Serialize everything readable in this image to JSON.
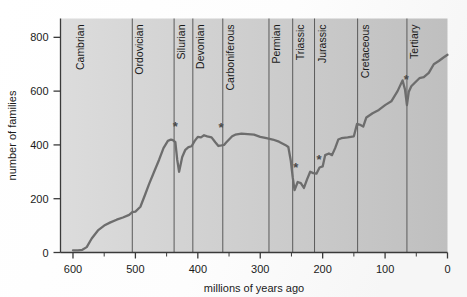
{
  "chart_data": {
    "type": "line",
    "title": "",
    "xlabel": "millions of years ago",
    "ylabel": "number of families",
    "xlim": [
      620,
      0
    ],
    "ylim": [
      0,
      870
    ],
    "x_ticks": [
      600,
      500,
      400,
      300,
      200,
      100,
      0
    ],
    "x_tick_labels": [
      "600",
      "500",
      "400",
      "300",
      "200",
      "100",
      "0"
    ],
    "x_minor_ticks": [
      550,
      450,
      350,
      250,
      150,
      50
    ],
    "y_ticks": [
      0,
      200,
      400,
      600,
      800
    ],
    "y_tick_labels": [
      "0",
      "200",
      "400",
      "600",
      "800"
    ],
    "x_axis_reversed": true,
    "grid": false,
    "legend": "none",
    "series": [
      {
        "name": "marine family diversity",
        "color": "#6d6d6d",
        "x": [
          600,
          592,
          585,
          578,
          570,
          560,
          550,
          540,
          530,
          520,
          510,
          505,
          500,
          492,
          485,
          478,
          470,
          462,
          455,
          448,
          443,
          440,
          436,
          433,
          430,
          425,
          420,
          415,
          410,
          405,
          400,
          395,
          390,
          385,
          378,
          372,
          367,
          362,
          358,
          355,
          350,
          345,
          340,
          330,
          320,
          310,
          300,
          290,
          280,
          270,
          260,
          255,
          251,
          248,
          245,
          240,
          235,
          230,
          225,
          220,
          215,
          210,
          205,
          200,
          196,
          190,
          185,
          180,
          175,
          170,
          160,
          150,
          145,
          140,
          135,
          130,
          120,
          110,
          100,
          90,
          80,
          72,
          68,
          65,
          62,
          58,
          52,
          45,
          38,
          30,
          22,
          14,
          7,
          0
        ],
        "y": [
          8,
          8,
          10,
          20,
          52,
          82,
          100,
          112,
          122,
          130,
          140,
          150,
          152,
          170,
          212,
          255,
          300,
          345,
          388,
          415,
          420,
          418,
          410,
          345,
          300,
          355,
          382,
          392,
          395,
          415,
          430,
          428,
          436,
          432,
          428,
          410,
          396,
          398,
          400,
          408,
          420,
          432,
          438,
          442,
          440,
          438,
          430,
          425,
          420,
          412,
          400,
          392,
          340,
          280,
          232,
          262,
          258,
          240,
          272,
          300,
          295,
          293,
          316,
          320,
          362,
          368,
          362,
          388,
          420,
          425,
          428,
          432,
          478,
          475,
          468,
          502,
          518,
          530,
          548,
          562,
          600,
          640,
          605,
          548,
          598,
          618,
          632,
          648,
          652,
          668,
          700,
          712,
          724,
          735
        ],
        "linewidth": 2.3
      }
    ],
    "annotations": [
      {
        "label": "*",
        "x": 436,
        "y": 452,
        "note": "end-Ordovician extinction"
      },
      {
        "label": "*",
        "x": 363,
        "y": 448,
        "note": "Late Devonian extinction"
      },
      {
        "label": "*",
        "x": 243,
        "y": 300,
        "note": "end-Permian extinction"
      },
      {
        "label": "*",
        "x": 206,
        "y": 328,
        "note": "end-Triassic extinction"
      },
      {
        "label": "*",
        "x": 66,
        "y": 628,
        "note": "end-Cretaceous extinction"
      }
    ],
    "periods": [
      {
        "name": "Cambrian",
        "start": 600,
        "end": 505
      },
      {
        "name": "Ordovician",
        "start": 505,
        "end": 438
      },
      {
        "name": "Silurian",
        "start": 438,
        "end": 408
      },
      {
        "name": "Devonian",
        "start": 408,
        "end": 360
      },
      {
        "name": "Carboniferous",
        "start": 360,
        "end": 286
      },
      {
        "name": "Permian",
        "start": 286,
        "end": 248
      },
      {
        "name": "Triassic",
        "start": 248,
        "end": 213
      },
      {
        "name": "Jurassic",
        "start": 213,
        "end": 144
      },
      {
        "name": "Cretaceous",
        "start": 144,
        "end": 65
      },
      {
        "name": "Tertiary",
        "start": 65,
        "end": 0
      }
    ],
    "colors": {
      "curve": "#6d6d6d",
      "axis": "#3a3a3a",
      "text": "#1b1b1b",
      "plot_bg_left": "#d4d4d4",
      "plot_bg_right": "#c2c2c2",
      "page_bg": "#ffffff",
      "period_divider": "#5a5a5a"
    }
  }
}
